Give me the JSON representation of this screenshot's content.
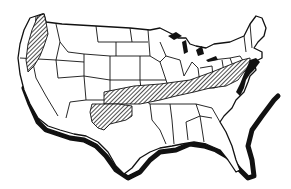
{
  "map": {
    "subject": "Contiguous United States outline map",
    "style": "black ink line drawing with state borders",
    "colors": {
      "background": "#ffffff",
      "ink": "#111111",
      "hatch": "#222222"
    },
    "highlighted_regions": [
      {
        "id": "pacific-northwest-coast",
        "pattern": "diagonal-hatch"
      },
      {
        "id": "central-appalachian-band",
        "pattern": "diagonal-hatch"
      },
      {
        "id": "southern-plains-lobe",
        "pattern": "diagonal-hatch"
      }
    ],
    "coast_shadow": "thick black drop-shadow along Pacific, Gulf and Atlantic coasts"
  }
}
